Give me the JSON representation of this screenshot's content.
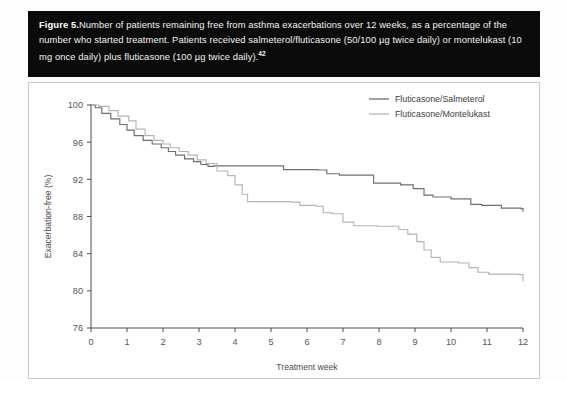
{
  "figure": {
    "label": "Figure 5.",
    "caption": "Number of patients remaining free from asthma exacerbations over 12 weeks, as a percentage of the number who started treatment. Patients received salmeterol/fluticasone (50/100 µg twice daily) or montelukast (10 mg once daily) plus fluticasone (100 µg twice daily).",
    "reference": "42"
  },
  "chart_data": {
    "type": "line",
    "subtype": "kaplan-meier-step",
    "title": "",
    "xlabel": "Treatment week",
    "ylabel": "Exacerbation-free (%)",
    "xlim": [
      0,
      12
    ],
    "ylim": [
      76,
      100
    ],
    "xticks": [
      0,
      1,
      2,
      3,
      4,
      5,
      6,
      7,
      8,
      9,
      10,
      11,
      12
    ],
    "xtick_labels": [
      "0",
      "1",
      "2",
      "3",
      "4",
      "5",
      "6",
      "7",
      "8",
      "9",
      "10",
      "11",
      "12"
    ],
    "yticks": [
      76,
      80,
      84,
      88,
      92,
      96,
      100
    ],
    "ytick_labels": [
      "76",
      "80",
      "84",
      "88",
      "92",
      "96",
      "100"
    ],
    "grid": false,
    "legend_position": "top-right",
    "series": [
      {
        "name": "Fluticasone/Salmeterol",
        "color": "#6e6e6e",
        "final_value": 88.5,
        "x": [
          0.0,
          0.12,
          0.3,
          0.55,
          0.8,
          1.0,
          1.2,
          1.45,
          1.7,
          1.95,
          2.15,
          2.35,
          2.6,
          2.85,
          3.05,
          3.25,
          3.4,
          5.1,
          5.35,
          6.3,
          6.55,
          6.9,
          7.55,
          7.85,
          8.6,
          8.95,
          9.25,
          9.5,
          10.0,
          10.55,
          10.85,
          11.4,
          11.95,
          12.0
        ],
        "y": [
          100.0,
          99.7,
          99.1,
          98.5,
          97.9,
          97.3,
          96.7,
          96.2,
          95.8,
          95.4,
          95.0,
          94.6,
          94.2,
          93.9,
          93.6,
          93.4,
          93.45,
          93.45,
          93.05,
          93.0,
          92.6,
          92.45,
          92.45,
          91.6,
          91.4,
          91.0,
          90.3,
          90.1,
          89.9,
          89.3,
          89.2,
          88.9,
          88.85,
          88.5
        ]
      },
      {
        "name": "Fluticasone/Montelukast",
        "color": "#b4b4b4",
        "final_value": 81.0,
        "x": [
          0.0,
          0.22,
          0.5,
          0.75,
          1.05,
          1.25,
          1.5,
          1.75,
          2.0,
          2.2,
          2.45,
          2.7,
          2.95,
          3.2,
          3.5,
          3.8,
          4.0,
          4.2,
          4.35,
          5.55,
          5.8,
          6.25,
          6.45,
          6.7,
          7.0,
          7.3,
          7.95,
          8.55,
          8.8,
          9.05,
          9.25,
          9.45,
          9.7,
          10.2,
          10.5,
          10.75,
          11.05,
          11.9,
          12.0
        ],
        "y": [
          100.0,
          99.85,
          99.4,
          98.8,
          98.3,
          97.4,
          96.7,
          96.2,
          95.8,
          95.4,
          95.0,
          94.6,
          94.1,
          93.7,
          92.9,
          92.4,
          91.4,
          90.4,
          89.6,
          89.55,
          89.2,
          89.1,
          88.4,
          88.3,
          87.4,
          87.0,
          86.95,
          86.6,
          86.1,
          85.3,
          84.4,
          83.6,
          83.1,
          83.0,
          82.5,
          82.0,
          81.8,
          81.75,
          81.0
        ]
      }
    ]
  }
}
